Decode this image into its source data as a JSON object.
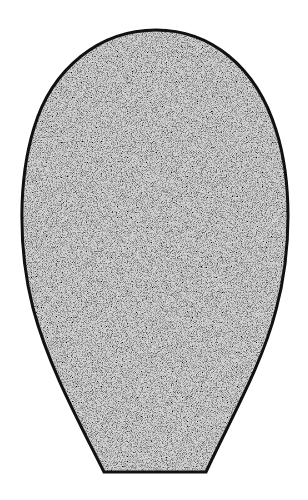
{
  "figure": {
    "shape": "egg-with-truncated-base",
    "fill_style": "stipple",
    "colors": {
      "background": "#ffffff",
      "stipple_base": "#d9d9d9",
      "stipple_dot": "#5a5a5a",
      "outline": "#111111"
    },
    "outline_width": 3
  }
}
